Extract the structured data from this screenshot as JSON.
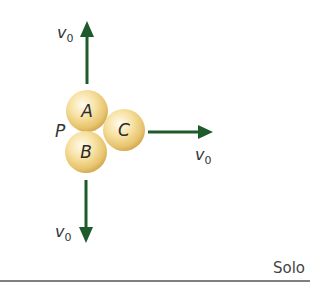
{
  "diagram": {
    "point_label": "P",
    "balls": [
      {
        "label": "A",
        "cx": 87,
        "cy": 111,
        "r": 21
      },
      {
        "label": "B",
        "cx": 86,
        "cy": 152,
        "r": 21
      },
      {
        "label": "C",
        "cx": 124,
        "cy": 130,
        "r": 21
      }
    ],
    "velocity_label": "v",
    "velocity_subscript": "0",
    "arrows": [
      {
        "direction": "up",
        "label": "v0"
      },
      {
        "direction": "right",
        "label": "v0"
      },
      {
        "direction": "down",
        "label": "v0"
      }
    ],
    "ground_label": "Solo",
    "colors": {
      "arrow": "#1e5a2a",
      "ball_light": "#fff6d8",
      "ball_mid": "#f6dc96",
      "ball_dark": "#d9b25a",
      "ground": "#555555"
    }
  }
}
